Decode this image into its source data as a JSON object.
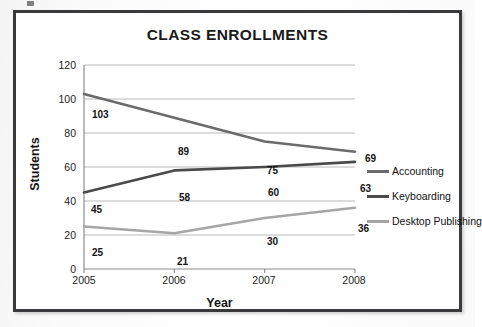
{
  "figure": {
    "title": "CLASS ENROLLMENTS",
    "frame_color": "#3a3a3c",
    "background": "#ffffff"
  },
  "chart_data": {
    "type": "line",
    "title": "CLASS ENROLLMENTS",
    "xlabel": "Year",
    "ylabel": "Students",
    "categories": [
      "2005",
      "2006",
      "2007",
      "2008"
    ],
    "x": [
      2005,
      2006,
      2007,
      2008
    ],
    "ylim": [
      0,
      120
    ],
    "yticks": [
      0,
      20,
      40,
      60,
      80,
      100,
      120
    ],
    "grid": "horizontal",
    "legend_position": "right",
    "series": [
      {
        "name": "Accounting",
        "color": "#6b6b6b",
        "values": [
          103,
          89,
          75,
          69
        ],
        "labels": [
          "103",
          "89",
          "75",
          "69"
        ]
      },
      {
        "name": "Keyboarding",
        "color": "#4a4a4a",
        "values": [
          45,
          58,
          60,
          63
        ],
        "labels": [
          "45",
          "58",
          "60",
          "63"
        ]
      },
      {
        "name": "Desktop Publishing",
        "color": "#a6a6a6",
        "values": [
          25,
          21,
          30,
          36
        ],
        "labels": [
          "25",
          "21",
          "30",
          "36"
        ]
      }
    ]
  },
  "axis": {
    "y_tick_labels": [
      "120",
      "100",
      "80",
      "60",
      "40",
      "20",
      "0"
    ],
    "x_tick_labels": [
      "2005",
      "2006",
      "2007",
      "2008"
    ],
    "y_title": "Students",
    "x_title": "Year"
  },
  "legend": {
    "items": [
      {
        "label": "Accounting",
        "color": "#6b6b6b"
      },
      {
        "label": "Keyboarding",
        "color": "#4a4a4a"
      },
      {
        "label": "Desktop Publishing",
        "color": "#a6a6a6"
      }
    ]
  },
  "point_labels": [
    {
      "text": "103",
      "left": 8,
      "top": 44
    },
    {
      "text": "89",
      "left": 94,
      "top": 81
    },
    {
      "text": "75",
      "left": 183,
      "top": 100
    },
    {
      "text": "69",
      "left": 281,
      "top": 88
    },
    {
      "text": "45",
      "left": 7,
      "top": 139
    },
    {
      "text": "58",
      "left": 95,
      "top": 127
    },
    {
      "text": "60",
      "left": 184,
      "top": 122
    },
    {
      "text": "63",
      "left": 276,
      "top": 118
    },
    {
      "text": "25",
      "left": 8,
      "top": 182
    },
    {
      "text": "21",
      "left": 93,
      "top": 191
    },
    {
      "text": "30",
      "left": 183,
      "top": 171
    },
    {
      "text": "36",
      "left": 274,
      "top": 158
    }
  ]
}
